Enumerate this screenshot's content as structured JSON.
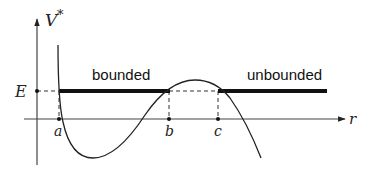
{
  "diagram": {
    "type": "effective-potential-plot",
    "y_axis_label": "V",
    "y_axis_label_sup": "*",
    "x_axis_label": "r",
    "energy_label": "E",
    "points": [
      {
        "id": "a",
        "label": "a"
      },
      {
        "id": "b",
        "label": "b"
      },
      {
        "id": "c",
        "label": "c"
      }
    ],
    "regions": [
      {
        "id": "bounded",
        "label": "bounded"
      },
      {
        "id": "unbounded",
        "label": "unbounded"
      }
    ],
    "colors": {
      "ink": "#222222",
      "background": "#ffffff"
    }
  }
}
